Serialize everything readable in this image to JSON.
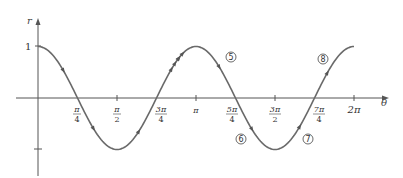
{
  "chart_data": {
    "type": "line",
    "title": "",
    "function": "r = cos(2θ)",
    "xlabel": "θ",
    "ylabel": "r",
    "xlim": [
      0,
      6.2832
    ],
    "ylim": [
      -1,
      1
    ],
    "grid": false,
    "legend": null,
    "x_ticks": [
      {
        "value": 0.7854,
        "label_num": "π",
        "label_den": "4"
      },
      {
        "value": 1.5708,
        "label_num": "π",
        "label_den": "2"
      },
      {
        "value": 2.3562,
        "label_num": "3π",
        "label_den": "4"
      },
      {
        "value": 3.1416,
        "label": "π"
      },
      {
        "value": 3.927,
        "label_num": "5π",
        "label_den": "4"
      },
      {
        "value": 4.7124,
        "label_num": "3π",
        "label_den": "2"
      },
      {
        "value": 5.4978,
        "label_num": "7π",
        "label_den": "4"
      },
      {
        "value": 6.2832,
        "label": "2π"
      }
    ],
    "y_ticks": [
      {
        "value": 1,
        "label": "1"
      },
      {
        "value": -1,
        "label": ""
      }
    ],
    "x": [
      0,
      0.3927,
      0.7854,
      1.1781,
      1.5708,
      1.9635,
      2.3562,
      2.7489,
      3.1416,
      3.5343,
      3.927,
      4.3197,
      4.7124,
      5.1051,
      5.4978,
      5.8905,
      6.2832
    ],
    "series": [
      {
        "name": "r = cos 2θ",
        "values": [
          1,
          0.707,
          0,
          -0.707,
          -1,
          -0.707,
          0,
          0.707,
          1,
          0.707,
          0,
          -0.707,
          -1,
          -0.707,
          0,
          0.707,
          1
        ]
      }
    ],
    "annotations": [
      {
        "label": "⑤",
        "theta_approx": 4.2,
        "r_approx": 0.77
      },
      {
        "label": "⑥",
        "theta_approx": 3.99,
        "r_approx": -0.79
      },
      {
        "label": "⑦",
        "theta_approx": 5.3,
        "r_approx": -0.79
      },
      {
        "label": "⑧",
        "theta_approx": 5.58,
        "r_approx": 0.75
      }
    ]
  },
  "labels": {
    "r_axis": "r",
    "theta_axis": "θ",
    "one": "1",
    "pi": "π",
    "two_pi": "2π",
    "pi_over_4_num": "π",
    "pi_over_4_den": "4",
    "pi_over_2_num": "π",
    "pi_over_2_den": "2",
    "three_pi_over_4_num": "3π",
    "three_pi_over_4_den": "4",
    "five_pi_over_4_num": "5π",
    "five_pi_over_4_den": "4",
    "three_pi_over_2_num": "3π",
    "three_pi_over_2_den": "2",
    "seven_pi_over_4_num": "7π",
    "seven_pi_over_4_den": "4",
    "c5": "5",
    "c6": "6",
    "c7": "7",
    "c8": "8"
  }
}
